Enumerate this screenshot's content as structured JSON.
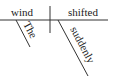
{
  "diagram": {
    "type": "sentence-diagram",
    "sentence": "The wind shifted suddenly",
    "subject": "wind",
    "predicate": "shifted",
    "modifiers": [
      {
        "word": "The",
        "modifies": "wind"
      },
      {
        "word": "suddenly",
        "modifies": "shifted"
      }
    ],
    "colors": {
      "ink": "#222222",
      "line": "#333333",
      "background": "#ffffff"
    }
  }
}
